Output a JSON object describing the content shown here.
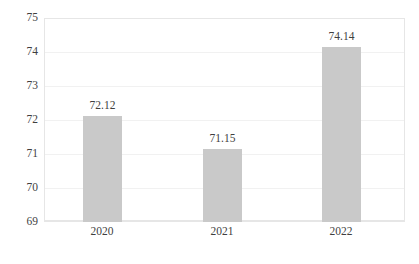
{
  "chart_data": {
    "type": "bar",
    "title": "",
    "subtitle": "",
    "xlabel": "",
    "ylabel": "",
    "categories": [
      "2020",
      "2021",
      "2022"
    ],
    "values": [
      72.12,
      71.15,
      74.14
    ],
    "value_labels": [
      "72.12",
      "71.15",
      "74.14"
    ],
    "ylim": [
      69,
      75
    ],
    "ytick_step": 1,
    "yticks": [
      75,
      74,
      73,
      72,
      71,
      70,
      69
    ],
    "ytick_labels": [
      "75",
      "74",
      "73",
      "72",
      "71",
      "70",
      "69"
    ],
    "grid": true,
    "grid_axis": "y",
    "legend": false,
    "legend_position": "none",
    "series": [
      {
        "name": "",
        "values": [
          72.12,
          71.15,
          74.14
        ]
      }
    ],
    "colors": {
      "bar_fill": "#c9c9c9",
      "grid": "#f1f1f1",
      "frame": "#e6e6e6",
      "text": "#3f3f3f",
      "background": "#ffffff"
    }
  }
}
